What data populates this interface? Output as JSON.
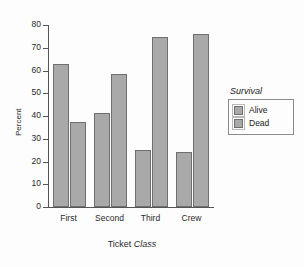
{
  "chart_data": {
    "type": "bar",
    "title": "",
    "xlabel": "Ticket Class",
    "xlabel_plain": "Ticket ",
    "xlabel_italic": "Class",
    "ylabel": "Percent",
    "categories": [
      "First",
      "Second",
      "Third",
      "Crew"
    ],
    "series": [
      {
        "name": "Alive",
        "values": [
          62.7,
          41.4,
          25.2,
          24.0
        ]
      },
      {
        "name": "Dead",
        "values": [
          37.3,
          58.6,
          74.8,
          76.0
        ]
      }
    ],
    "ylim": [
      0,
      80
    ],
    "ytick_values": [
      0,
      10,
      20,
      30,
      40,
      50,
      60,
      70,
      80
    ],
    "ytick_labels": [
      "0",
      "10",
      "20",
      "30",
      "40",
      "50",
      "60",
      "70",
      "80"
    ],
    "grid": false,
    "legend": {
      "title": "Survival",
      "position": "right",
      "entries": [
        "Alive",
        "Dead"
      ]
    },
    "colors": {
      "bar_fill": "#a9a9a9",
      "bar_edge": "#6f6f6f",
      "axis": "#555555",
      "text": "#1a1a1a",
      "background": "#fdfdfd"
    }
  }
}
